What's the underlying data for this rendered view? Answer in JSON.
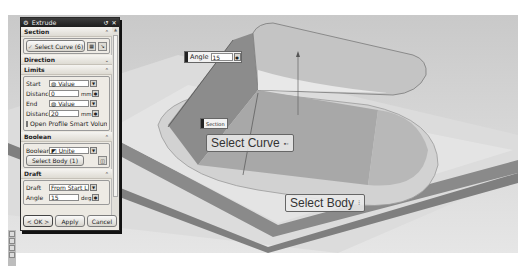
{
  "dialog": {
    "title": "Extrude",
    "title_buttons": [
      "reset-icon",
      "close-icon"
    ],
    "sections": {
      "section": {
        "label": "Section",
        "select_curve_label": "Select Curve (6)"
      },
      "direction": {
        "label": "Direction"
      },
      "limits": {
        "label": "Limits",
        "start_label": "Start",
        "start_value": "Value",
        "start_distance_label": "Distance",
        "start_distance": "0",
        "start_unit": "mm",
        "end_label": "End",
        "end_value": "Value",
        "end_distance_label": "Distance",
        "end_distance": "20",
        "end_unit": "mm",
        "open_profile_label": "Open Profile Smart Volume"
      },
      "boolean": {
        "label": "Boolean",
        "boolean_label": "Boolean",
        "boolean_value": "Unite",
        "select_body_label": "Select Body (1)"
      },
      "draft": {
        "label": "Draft",
        "draft_label": "Draft",
        "draft_value": "From Start Limit",
        "angle_label": "Angle",
        "angle_value": "15",
        "angle_unit": "deg"
      }
    },
    "buttons": {
      "ok": "< OK >",
      "apply": "Apply",
      "cancel": "Cancel"
    }
  },
  "viewport": {
    "angle_tag": {
      "label": "Angle",
      "value": "15"
    },
    "section_tag": {
      "label": "Section"
    },
    "select_curve_hint": "Select Curve",
    "select_body_hint": "Select Body"
  }
}
